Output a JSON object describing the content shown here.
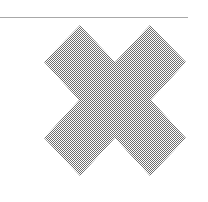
{
  "image": {
    "icon": "close-x-icon",
    "fill_pattern": "checkerboard-dither",
    "fill_color": "#6e6e6e",
    "background": "#ffffff",
    "rule_color": "#a8a8a8"
  }
}
